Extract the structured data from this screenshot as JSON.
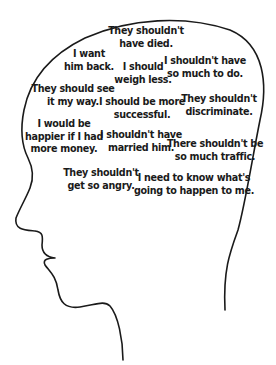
{
  "diagram": {
    "type": "head-profile-thought-bubble",
    "outline_color": "#1a1a1a",
    "background": "#ffffff",
    "thoughts": [
      {
        "id": "died",
        "lines": [
          "They shouldn't",
          "have died."
        ]
      },
      {
        "id": "him-back",
        "lines": [
          "I want",
          "him back."
        ]
      },
      {
        "id": "weigh-less",
        "lines": [
          "I should",
          "weigh less."
        ]
      },
      {
        "id": "so-much",
        "lines": [
          "I shouldn't have",
          "so much to do."
        ]
      },
      {
        "id": "my-way",
        "lines": [
          "They should see",
          "it my way."
        ]
      },
      {
        "id": "successful",
        "lines": [
          "I should be more",
          "successful."
        ]
      },
      {
        "id": "discriminate",
        "lines": [
          "They shouldn't",
          "discriminate."
        ]
      },
      {
        "id": "money",
        "lines": [
          "I would be",
          "happier if I had",
          "more money."
        ]
      },
      {
        "id": "married",
        "lines": [
          "I shouldn't have",
          "married him."
        ]
      },
      {
        "id": "traffic",
        "lines": [
          "There shouldn't be",
          "so much traffic."
        ]
      },
      {
        "id": "angry",
        "lines": [
          "They shouldn't",
          "get so angry."
        ]
      },
      {
        "id": "future",
        "lines": [
          "I need to know what's",
          "going to happen to me."
        ]
      }
    ]
  }
}
